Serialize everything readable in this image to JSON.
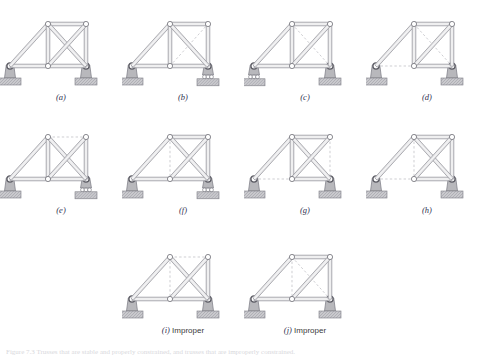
{
  "figure": {
    "width": 488,
    "height": 359,
    "background": "#ffffff",
    "caption_bottom": "Figure 7.3 Trusses that are stable and properly constrained, and trusses that are improperly constrained."
  },
  "style": {
    "member_fill": "#e8e8ea",
    "member_stroke": "#8e8e95",
    "dashed_stroke": "#b9b9bf",
    "node_fill": "#ffffff",
    "node_stroke": "#6e6e76",
    "support_fill": "#b8b8bc",
    "support_stroke": "#7a7a82",
    "ground_fill": "#c9c9cd",
    "ground_hatch": "#8e8e96",
    "label_color": "#2f2f4f",
    "accent_olive": "#b9b94a",
    "accent_violet": "#9a8fd8",
    "accent_magenta": "#b558a8",
    "accent_green": "#5fbf6a",
    "accent_rose": "#c07a8e"
  },
  "geometry": {
    "nodes": {
      "A": {
        "x": 10,
        "y": 62,
        "name": "left-support-node"
      },
      "B": {
        "x": 48,
        "y": 62,
        "name": "bottom-middle-node"
      },
      "C": {
        "x": 86,
        "y": 62,
        "name": "right-support-node"
      },
      "D": {
        "x": 48,
        "y": 20,
        "name": "top-left-node"
      },
      "E": {
        "x": 86,
        "y": 20,
        "name": "top-right-node"
      }
    },
    "members": [
      {
        "id": "AB",
        "from": "A",
        "to": "B",
        "label": "bottom-left-chord"
      },
      {
        "id": "BC",
        "from": "B",
        "to": "C",
        "label": "bottom-right-chord"
      },
      {
        "id": "AD",
        "from": "A",
        "to": "D",
        "label": "left-inclined-chord"
      },
      {
        "id": "DE",
        "from": "D",
        "to": "E",
        "label": "top-chord"
      },
      {
        "id": "DB",
        "from": "D",
        "to": "B",
        "label": "left-vertical"
      },
      {
        "id": "EC",
        "from": "E",
        "to": "C",
        "label": "right-vertical"
      },
      {
        "id": "DC",
        "from": "D",
        "to": "C",
        "label": "diagonal-down-right"
      },
      {
        "id": "BE",
        "from": "B",
        "to": "E",
        "label": "diagonal-up-right"
      }
    ]
  },
  "panels": [
    {
      "id": "a",
      "label": "(a)",
      "note": "",
      "col": 0,
      "row": 0,
      "left_support": "pin",
      "right_support": "pin",
      "solid": [
        "AB",
        "BC",
        "AD",
        "DE",
        "DB",
        "EC",
        "DC",
        "BE"
      ],
      "dashed": [],
      "highlights": [
        {
          "member": "AB",
          "color": "accent_olive"
        },
        {
          "member": "BC",
          "color": "accent_violet"
        }
      ]
    },
    {
      "id": "b",
      "label": "(b)",
      "note": "",
      "col": 1,
      "row": 0,
      "left_support": "pin",
      "right_support": "roller",
      "solid": [
        "AB",
        "BC",
        "AD",
        "DE",
        "DB",
        "EC",
        "DC"
      ],
      "dashed": [
        "BE"
      ],
      "highlights": [
        {
          "member": "AB",
          "color": "accent_olive"
        }
      ]
    },
    {
      "id": "c",
      "label": "(c)",
      "note": "",
      "col": 2,
      "row": 0,
      "left_support": "roller",
      "right_support": "pin",
      "solid": [
        "AB",
        "BC",
        "AD",
        "DE",
        "DB",
        "EC",
        "BE"
      ],
      "dashed": [
        "DC"
      ],
      "highlights": [
        {
          "member": "AB",
          "color": "accent_magenta"
        },
        {
          "member": "BC",
          "color": "accent_green"
        }
      ]
    },
    {
      "id": "d",
      "label": "(d)",
      "note": "",
      "col": 3,
      "row": 0,
      "left_support": "pin",
      "right_support": "pin",
      "solid": [
        "BC",
        "AD",
        "DE",
        "DB",
        "EC",
        "BE"
      ],
      "dashed": [
        "AB",
        "DC"
      ],
      "highlights": [
        {
          "member": "BC",
          "color": "accent_violet"
        }
      ]
    },
    {
      "id": "e",
      "label": "(e)",
      "note": "",
      "col": 0,
      "row": 1,
      "left_support": "pin",
      "right_support": "roller",
      "solid": [
        "AB",
        "BC",
        "AD",
        "DB",
        "EC",
        "DC",
        "BE"
      ],
      "dashed": [
        "DE"
      ],
      "highlights": []
    },
    {
      "id": "f",
      "label": "(f)",
      "note": "",
      "col": 1,
      "row": 1,
      "left_support": "pin",
      "right_support": "roller",
      "solid": [
        "AB",
        "BC",
        "AD",
        "DE",
        "EC",
        "DC",
        "BE"
      ],
      "dashed": [
        "DB"
      ],
      "highlights": [
        {
          "member": "AB",
          "color": "accent_magenta"
        },
        {
          "member": "BC",
          "color": "accent_green"
        }
      ]
    },
    {
      "id": "g",
      "label": "(g)",
      "note": "",
      "col": 2,
      "row": 1,
      "left_support": "pin",
      "right_support": "pin",
      "solid": [
        "BC",
        "AD",
        "DE",
        "DB",
        "DC",
        "BE"
      ],
      "dashed": [
        "AB",
        "EC"
      ],
      "highlights": [
        {
          "member": "BC",
          "color": "accent_olive"
        }
      ]
    },
    {
      "id": "h",
      "label": "(h)",
      "note": "",
      "col": 3,
      "row": 1,
      "left_support": "pin",
      "right_support": "pin",
      "solid": [
        "BC",
        "AD",
        "DE",
        "EC",
        "DC",
        "BE"
      ],
      "dashed": [
        "AB",
        "DB"
      ],
      "highlights": []
    },
    {
      "id": "i",
      "label": "(i)",
      "note": "Improper",
      "col": 1,
      "row": 2,
      "left_support": "pin",
      "right_support": "pin",
      "solid": [
        "AB",
        "BC",
        "AD",
        "EC",
        "DC",
        "BE"
      ],
      "dashed": [
        "DE",
        "DB"
      ],
      "highlights": []
    },
    {
      "id": "j",
      "label": "(j)",
      "note": "Improper",
      "col": 2,
      "row": 2,
      "left_support": "pin",
      "right_support": "pin",
      "solid": [
        "AB",
        "BC",
        "AD",
        "DE",
        "EC",
        "BE"
      ],
      "dashed": [
        "DB",
        "DC"
      ],
      "highlights": []
    }
  ]
}
